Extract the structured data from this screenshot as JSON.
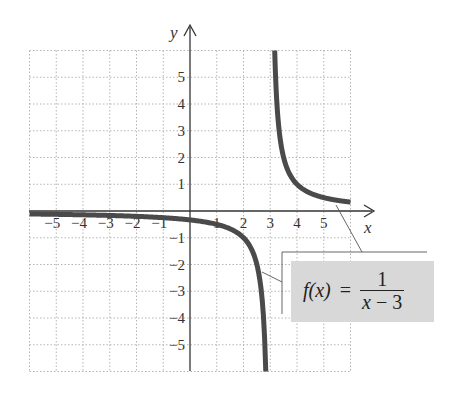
{
  "chart_data": {
    "type": "line",
    "title": "",
    "function_label": "f(x) = 1/(x − 3)",
    "formula": {
      "lhs": "f(x)",
      "eq": "=",
      "numerator": "1",
      "denominator_var": "x",
      "denominator_rest": " − 3"
    },
    "xlabel": "x",
    "ylabel": "y",
    "xlim": [
      -6,
      6
    ],
    "ylim": [
      -6,
      6
    ],
    "grid": true,
    "x_ticks": [
      "−5",
      "−4",
      "−3",
      "−2",
      "−1",
      "1",
      "2",
      "3",
      "4",
      "5"
    ],
    "y_ticks": [
      "5",
      "4",
      "3",
      "2",
      "1",
      "−1",
      "−2",
      "−3",
      "−4",
      "−5"
    ],
    "vertical_asymptote": 3,
    "horizontal_asymptote": 0,
    "series": [
      {
        "name": "left branch",
        "x": [
          -6,
          -5,
          -4,
          -3,
          -2,
          -1,
          0,
          1,
          2,
          2.5,
          2.8,
          2.833
        ],
        "y": [
          -0.111,
          -0.125,
          -0.143,
          -0.167,
          -0.2,
          -0.25,
          -0.333,
          -0.5,
          -1,
          -2,
          -5,
          -6
        ]
      },
      {
        "name": "right branch",
        "x": [
          3.167,
          3.2,
          3.5,
          4,
          5,
          6
        ],
        "y": [
          6,
          5,
          2,
          1,
          0.5,
          0.333
        ]
      }
    ],
    "colors": {
      "curve": "#4a4a4a",
      "grid": "#b0b0b0",
      "axis": "#333333",
      "label_box": "#d8d8d8"
    }
  }
}
